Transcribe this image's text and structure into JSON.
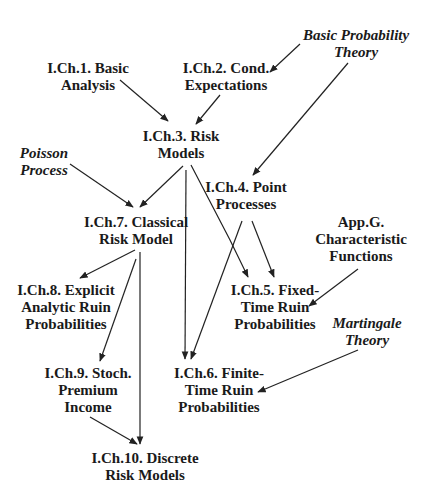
{
  "diagram": {
    "type": "dependency-graph",
    "colors": {
      "background": "#ffffff",
      "text": "#1a1a1a",
      "edge": "#222222"
    },
    "nodes": [
      {
        "id": "bpt",
        "kind": "external",
        "lines": [
          "Basic Probability",
          "Theory"
        ],
        "x": 356,
        "y": 27
      },
      {
        "id": "ch1",
        "kind": "chapter",
        "lines": [
          "I.Ch.1. Basic",
          "Analysis"
        ],
        "x": 88,
        "y": 60
      },
      {
        "id": "ch2",
        "kind": "chapter",
        "lines": [
          "I.Ch.2. Cond.",
          "Expectations"
        ],
        "x": 226,
        "y": 60
      },
      {
        "id": "ch3",
        "kind": "chapter",
        "lines": [
          "I.Ch.3. Risk",
          "Models"
        ],
        "x": 181,
        "y": 128
      },
      {
        "id": "pp",
        "kind": "external",
        "lines": [
          "Poisson",
          "Process"
        ],
        "x": 44,
        "y": 145
      },
      {
        "id": "ch4",
        "kind": "chapter",
        "lines": [
          "I.Ch.4. Point",
          "Processes"
        ],
        "x": 246,
        "y": 179
      },
      {
        "id": "ch7",
        "kind": "chapter",
        "lines": [
          "I.Ch.7. Classical",
          "Risk Model"
        ],
        "x": 136,
        "y": 214
      },
      {
        "id": "appg",
        "kind": "chapter",
        "lines": [
          "App.G.",
          "Characteristic",
          "Functions"
        ],
        "x": 361,
        "y": 214
      },
      {
        "id": "ch8",
        "kind": "chapter",
        "lines": [
          "I.Ch.8. Explicit",
          "Analytic  Ruin",
          "Probabilities"
        ],
        "x": 66,
        "y": 282
      },
      {
        "id": "ch5",
        "kind": "chapter",
        "lines": [
          "I.Ch.5. Fixed-",
          "Time Ruin",
          "Probabilities"
        ],
        "x": 275,
        "y": 282
      },
      {
        "id": "mt",
        "kind": "external",
        "lines": [
          "Martingale",
          "Theory"
        ],
        "x": 367,
        "y": 315
      },
      {
        "id": "ch9",
        "kind": "chapter",
        "lines": [
          "I.Ch.9. Stoch.",
          "Premium",
          "Income"
        ],
        "x": 88,
        "y": 365
      },
      {
        "id": "ch6",
        "kind": "chapter",
        "lines": [
          "I.Ch.6. Finite-",
          "Time Ruin",
          "Probabilities"
        ],
        "x": 219,
        "y": 365
      },
      {
        "id": "ch10",
        "kind": "chapter",
        "lines": [
          "I.Ch.10. Discrete",
          "Risk Models"
        ],
        "x": 145,
        "y": 450
      }
    ],
    "edges": [
      {
        "from": "bpt",
        "to": "ch2",
        "x1": 300,
        "y1": 44,
        "x2": 270,
        "y2": 72
      },
      {
        "from": "bpt",
        "to": "ch4",
        "x1": 348,
        "y1": 63,
        "x2": 253,
        "y2": 175
      },
      {
        "from": "ch1",
        "to": "ch3",
        "x1": 120,
        "y1": 80,
        "x2": 168,
        "y2": 121
      },
      {
        "from": "ch2",
        "to": "ch3",
        "x1": 220,
        "y1": 95,
        "x2": 196,
        "y2": 124
      },
      {
        "from": "ch3",
        "to": "ch7",
        "x1": 183,
        "y1": 166,
        "x2": 140,
        "y2": 207
      },
      {
        "from": "pp",
        "to": "ch7",
        "x1": 70,
        "y1": 164,
        "x2": 133,
        "y2": 207
      },
      {
        "from": "ch3",
        "to": "ch6",
        "x1": 186,
        "y1": 170,
        "x2": 185,
        "y2": 359
      },
      {
        "from": "ch3",
        "to": "ch5",
        "x1": 191,
        "y1": 165,
        "x2": 230,
        "y2": 240,
        "x3": 248,
        "y3": 277
      },
      {
        "from": "ch4",
        "to": "ch5",
        "x1": 252,
        "y1": 221,
        "x2": 274,
        "y2": 277
      },
      {
        "from": "ch4",
        "to": "ch6",
        "x1": 242,
        "y1": 221,
        "x2": 191,
        "y2": 359
      },
      {
        "from": "ch7",
        "to": "ch8",
        "x1": 135,
        "y1": 250,
        "x2": 80,
        "y2": 278
      },
      {
        "from": "ch7",
        "to": "ch9",
        "x1": 136,
        "y1": 259,
        "x2": 100,
        "y2": 361
      },
      {
        "from": "ch7",
        "to": "ch10",
        "x1": 140,
        "y1": 252,
        "x2": 140,
        "y2": 444
      },
      {
        "from": "appg",
        "to": "ch5",
        "x1": 358,
        "y1": 269,
        "x2": 309,
        "y2": 306
      },
      {
        "from": "mt",
        "to": "ch6",
        "x1": 358,
        "y1": 350,
        "x2": 258,
        "y2": 392
      },
      {
        "from": "ch9",
        "to": "ch10",
        "x1": 90,
        "y1": 417,
        "x2": 137,
        "y2": 444
      }
    ]
  }
}
